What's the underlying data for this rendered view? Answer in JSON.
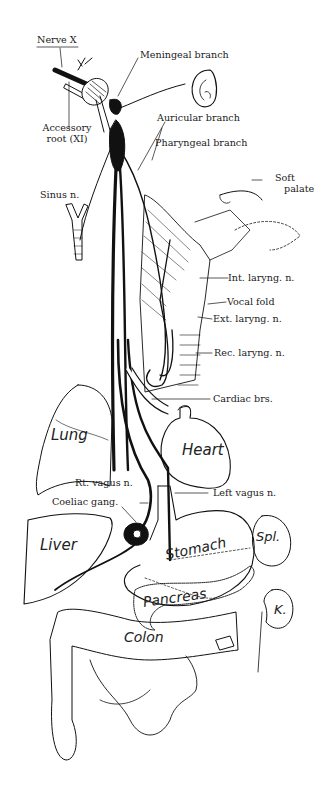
{
  "diagram": {
    "labels": {
      "nerve_x": "Nerve X",
      "meningeal_branch": "Meningeal branch",
      "auricular_branch": "Auricular branch",
      "accessory_root_line1": "Accessory",
      "accessory_root_line2": "root (XI)",
      "pharyngeal_branch": "Pharyngeal branch",
      "sinus_n": "Sinus n.",
      "soft_palate_line1": "Soft",
      "soft_palate_line2": "palate",
      "int_laryng_n": "Int. laryng. n.",
      "vocal_fold": "Vocal fold",
      "ext_laryng_n": "Ext. laryng. n.",
      "rec_laryng_n": "Rec. laryng. n.",
      "cardiac_brs": "Cardiac brs.",
      "rt_vagus_n": "Rt. vagus n.",
      "left_vagus_n": "Left vagus n.",
      "coeliac_gang": "Coeliac gang."
    },
    "organs": {
      "lung": "Lung",
      "heart": "Heart",
      "liver": "Liver",
      "stomach": "Stomach",
      "spleen": "Spl.",
      "pancreas": "Pancreas",
      "kidney": "K.",
      "colon": "Colon"
    },
    "colors": {
      "ink": "#111111",
      "background": "#ffffff"
    }
  }
}
